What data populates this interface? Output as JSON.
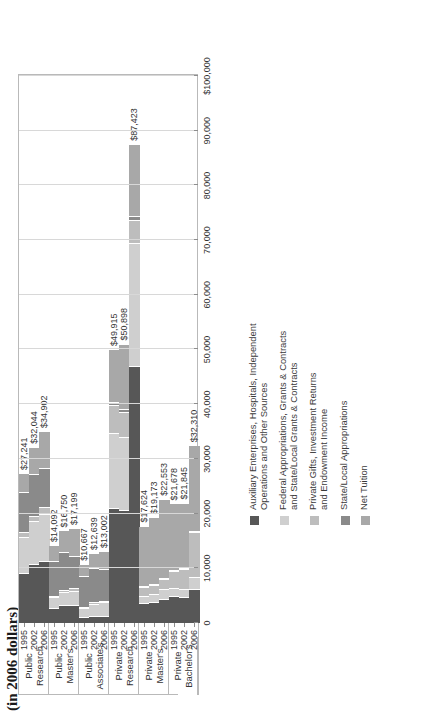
{
  "title": "(in 2006 dollars)",
  "legend": {
    "items": [
      {
        "label": "Auxiliary Enterprises, Hospitals, Independent\nOperations and Other Sources",
        "color": "#575757"
      },
      {
        "label": "Federal Appropriations, Grants & Contracts\nand State/Local Grants & Contracts",
        "color": "#cfcfcf"
      },
      {
        "label": "Private Gifts, Investment Returns\nand Endowment Income",
        "color": "#bdbdbd"
      },
      {
        "label": "State/Local Appropriations",
        "color": "#8a8a8a"
      },
      {
        "label": "Net Tuition",
        "color": "#a8a8a8"
      }
    ]
  },
  "chart_data": {
    "type": "bar",
    "subtype": "stacked-horizontal",
    "title": "(in 2006 dollars)",
    "xlabel": "",
    "ylabel": "",
    "xlim": [
      0,
      100000
    ],
    "grid": true,
    "legend_position": "right",
    "xticks": [
      "0",
      "10,000",
      "20,000",
      "30,000",
      "40,000",
      "50,000",
      "60,000",
      "70,000",
      "80,000",
      "90,000",
      "$100,000"
    ],
    "xtick_values": [
      0,
      10000,
      20000,
      30000,
      40000,
      50000,
      60000,
      70000,
      80000,
      90000,
      100000
    ],
    "series": [
      {
        "name": "Auxiliary Enterprises, Hospitals, Independent Operations and Other Sources",
        "color": "#575757"
      },
      {
        "name": "Federal Appropriations, Grants & Contracts and State/Local Grants & Contracts",
        "color": "#cfcfcf"
      },
      {
        "name": "Private Gifts, Investment Returns and Endowment Income",
        "color": "#bdbdbd"
      },
      {
        "name": "State/Local Appropriations",
        "color": "#8a8a8a"
      },
      {
        "name": "Net Tuition",
        "color": "#a8a8a8"
      }
    ],
    "groups": [
      {
        "name": "Public Research",
        "rows": [
          {
            "year": "1995",
            "total_label": "$27,241",
            "total": 27241,
            "values": [
              9100,
              6600,
              1000,
              7300,
              3241
            ]
          },
          {
            "year": "2002",
            "total_label": "$32,044",
            "total": 32044,
            "values": [
              10700,
              7900,
              900,
              7700,
              4844
            ]
          },
          {
            "year": "2006",
            "total_label": "$34,902",
            "total": 34902,
            "values": [
              11300,
              8600,
              1300,
              7100,
              6602
            ]
          }
        ]
      },
      {
        "name": "Public Master's",
        "rows": [
          {
            "year": "1995",
            "total_label": "$14,092",
            "total": 14092,
            "values": [
              2700,
              2000,
              300,
              6400,
              2692
            ]
          },
          {
            "year": "2002",
            "total_label": "$16,750",
            "total": 16750,
            "values": [
              3200,
              2400,
              400,
              6900,
              3850
            ]
          },
          {
            "year": "2006",
            "total_label": "$17,199",
            "total": 17199,
            "values": [
              3300,
              2600,
              500,
              5900,
              4899
            ]
          }
        ]
      },
      {
        "name": "Public Associate's",
        "rows": [
          {
            "year": "1995",
            "total_label": "$10,667",
            "total": 10667,
            "values": [
              1100,
              1700,
              200,
              5600,
              2067
            ]
          },
          {
            "year": "2002",
            "total_label": "$12,639",
            "total": 12639,
            "values": [
              1300,
              2200,
              300,
              6200,
              2639
            ]
          },
          {
            "year": "2006",
            "total_label": "$13,002",
            "total": 13002,
            "values": [
              1300,
              2500,
              300,
              5800,
              3102
            ]
          }
        ]
      },
      {
        "name": "Private Research",
        "rows": [
          {
            "year": "1995",
            "total_label": "$49,915",
            "total": 49915,
            "values": [
              21000,
              13800,
              5000,
              600,
              9515
            ]
          },
          {
            "year": "2002",
            "total_label": "$50,898",
            "total": 50898,
            "values": [
              20700,
              13300,
              4600,
              600,
              11698
            ]
          },
          {
            "year": "2006",
            "total_label": "$87,423",
            "total": 87423,
            "values": [
              47000,
              22500,
              4200,
              700,
              13023
            ]
          }
        ]
      },
      {
        "name": "Private Master's",
        "rows": [
          {
            "year": "1995",
            "total_label": "$17,624",
            "total": 17624,
            "values": [
              3700,
              1300,
              1500,
              200,
              10924
            ]
          },
          {
            "year": "2002",
            "total_label": "$19,173",
            "total": 19173,
            "values": [
              3800,
              1500,
              1700,
              200,
              11973
            ]
          },
          {
            "year": "2006",
            "total_label": "$22,553",
            "total": 22553,
            "values": [
              4300,
              2000,
              1800,
              200,
              14253
            ]
          }
        ]
      },
      {
        "name": "Private Bachelor's",
        "rows": [
          {
            "year": "1995",
            "total_label": "$21,678",
            "total": 21678,
            "values": [
              5000,
              1400,
              3100,
              200,
              11978
            ]
          },
          {
            "year": "2002",
            "total_label": "$21,845",
            "total": 21845,
            "values": [
              4700,
              1500,
              3600,
              200,
              11845
            ]
          },
          {
            "year": "2006",
            "total_label": "$32,310",
            "total": 32310,
            "values": [
              6300,
              2100,
              8200,
              300,
              15410
            ]
          }
        ]
      }
    ]
  }
}
